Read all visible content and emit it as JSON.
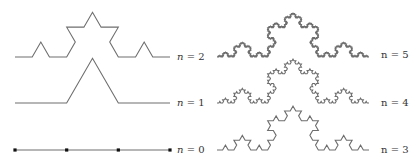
{
  "figure": {
    "colors": {
      "curve": "#6e6e6e",
      "dot": "#111111",
      "label": "#333333",
      "background": "#ffffff"
    },
    "panels": [
      {
        "id": "left",
        "x0": 15,
        "x1": 170,
        "curves": [
          {
            "n": 2,
            "baseline_y": 57,
            "label": "n = 2",
            "label_x": 177
          },
          {
            "n": 1,
            "baseline_y": 103,
            "label": "n = 1",
            "label_x": 177
          },
          {
            "n": 0,
            "baseline_y": 150,
            "label": "n = 0",
            "label_x": 177,
            "show_dots": true
          }
        ]
      },
      {
        "id": "right",
        "x0": 217,
        "x1": 369,
        "curves": [
          {
            "n": 5,
            "baseline_y": 57,
            "label": "n = 5",
            "label_x": 381
          },
          {
            "n": 4,
            "baseline_y": 103,
            "label": "n = 4",
            "label_x": 381
          },
          {
            "n": 3,
            "baseline_y": 150,
            "label": "n = 3",
            "label_x": 381
          }
        ]
      }
    ]
  },
  "labels": {
    "n2": "n",
    "n1": "n",
    "n0": "n",
    "n5": "n",
    "n4": "n",
    "n3": "n",
    "v2": " = 2",
    "v1": " = 1",
    "v0": " = 0",
    "v5": " = 5",
    "v4": " = 4",
    "v3": " = 3"
  }
}
